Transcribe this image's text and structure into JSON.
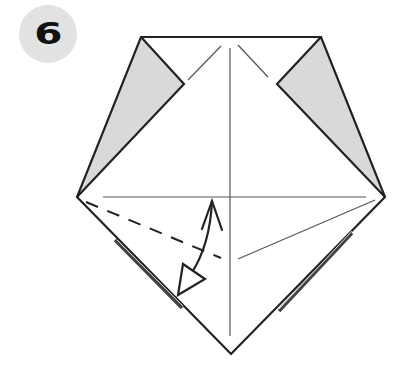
{
  "step": {
    "number": "6",
    "badge_color": "#e2e2e2",
    "number_color": "#111111"
  },
  "diagram": {
    "colors": {
      "outline": "#222222",
      "crease": "#555555",
      "flap_fill": "#d9d9d9",
      "arrow": "#222222"
    },
    "elements": [
      "outline-pentagon",
      "left-shaded-flap",
      "right-shaded-flap",
      "vertical-center-crease",
      "horizontal-crease",
      "upper-left-crease",
      "upper-right-crease",
      "valley-fold-dashed-line",
      "right-diagonal-crease",
      "fold-unfold-arrow"
    ]
  }
}
